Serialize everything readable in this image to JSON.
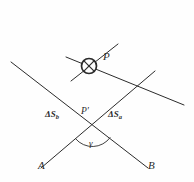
{
  "figure": {
    "kind": "geometry-diagram",
    "background_color": "#fefefe",
    "ink_color": "#2b2b2b",
    "stroke_width": 1,
    "labels": {
      "point_p": "P",
      "point_p_prime": "P′",
      "ray_a": "A",
      "ray_b": "B",
      "angle_gamma": "γ",
      "segment_b_delta": "Δ",
      "segment_b_symbol": "S",
      "segment_b_subscript": "b",
      "segment_a_delta": "Δ",
      "segment_a_symbol": "S",
      "segment_a_subscript": "a"
    },
    "marker": {
      "name": "crossed-circle",
      "center_x": 89,
      "center_y": 66,
      "radius": 7.5
    },
    "points": {
      "p_prime_x": 93,
      "p_prime_y": 126
    },
    "lines": [
      {
        "name": "ray-a",
        "x1": 41,
        "y1": 168,
        "x2": 155,
        "y2": 71
      },
      {
        "name": "ray-b",
        "x1": 148,
        "y1": 168,
        "x2": 11,
        "y2": 62
      },
      {
        "name": "transversal-lower-right",
        "x1": 66,
        "y1": 57,
        "x2": 184,
        "y2": 105
      },
      {
        "name": "transversal-upper-right",
        "x1": 71,
        "y1": 81,
        "x2": 118,
        "y2": 44
      }
    ],
    "angle_arc": {
      "name": "gamma-arc",
      "cx": 93,
      "cy": 126,
      "radius": 22
    },
    "ghost_text": ""
  }
}
